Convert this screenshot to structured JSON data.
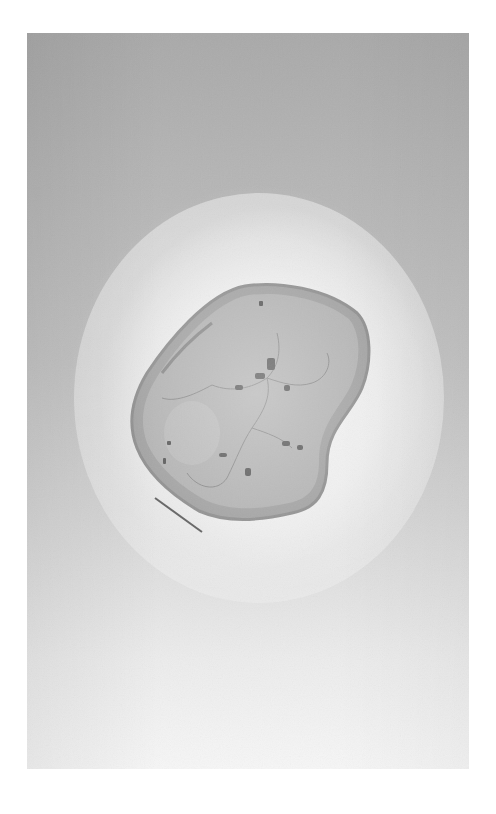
{
  "image": {
    "subject": "Aerial grayscale photograph of a raised coral island surrounded by a fringing reef",
    "colors": {
      "background": "#ffffff",
      "water_dark": "#a9a9a9",
      "water_light": "#f6f6f6",
      "reef": "#ededed",
      "island_fill": "#a8a8a8",
      "coast_ring": "#8c8c8c"
    }
  }
}
